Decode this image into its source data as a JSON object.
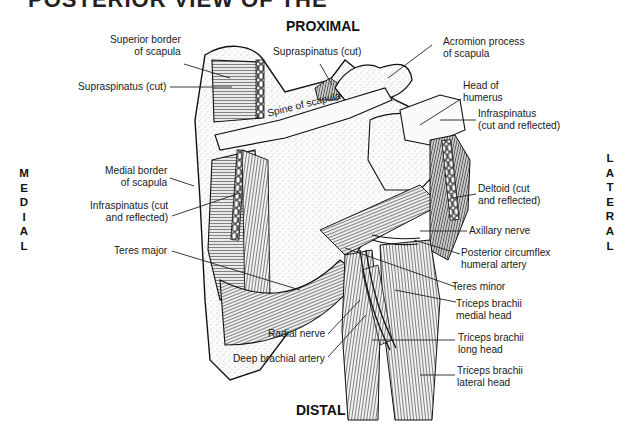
{
  "figure": {
    "title_partial": "POSTERIOR VIEW OF THE",
    "orientation": {
      "top": "PROXIMAL",
      "bottom": "DISTAL",
      "left": "MEDIAL",
      "right": "LATERAL"
    },
    "labels": {
      "superior_border": [
        "Superior border",
        "of scapula"
      ],
      "supraspinatus_left": "Supraspinatus (cut)",
      "supraspinatus_top": "Supraspinatus (cut)",
      "acromion": [
        "Acromion process",
        "of scapula"
      ],
      "spine_of_scapula": "Spine of scapula",
      "head_of_humerus": [
        "Head of",
        "humerus"
      ],
      "infraspinatus_right": [
        "Infraspinatus",
        "(cut and reflected)"
      ],
      "medial_border": [
        "Medial border",
        "of scapula"
      ],
      "infraspinatus_left": [
        "Infraspinatus (cut",
        "and reflected)"
      ],
      "deltoid": [
        "Deltoid (cut",
        "and reflected)"
      ],
      "axillary_nerve": "Axillary nerve",
      "posterior_circumflex": [
        "Posterior circumflex",
        "humeral artery"
      ],
      "teres_major": "Teres major",
      "teres_minor": "Teres minor",
      "triceps_medial": [
        "Triceps brachii",
        "medial head"
      ],
      "radial_nerve": "Radial nerve",
      "triceps_long": [
        "Triceps brachii",
        "long head"
      ],
      "deep_brachial": "Deep brachial artery",
      "triceps_lateral": [
        "Triceps brachii",
        "lateral head"
      ]
    }
  }
}
